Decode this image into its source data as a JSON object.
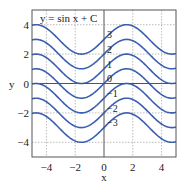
{
  "chart_data": {
    "type": "line",
    "title": "y = sin x + C",
    "xlabel": "x",
    "ylabel": "y",
    "xlim": [
      -5,
      5
    ],
    "ylim": [
      -5,
      5
    ],
    "xticks": [
      -4,
      -2,
      0,
      2,
      4
    ],
    "yticks": [
      -4,
      -2,
      0,
      2,
      4
    ],
    "xtick_labels": [
      "−4",
      "−2",
      "0",
      "2",
      "4"
    ],
    "ytick_labels": [
      "−4",
      "−2",
      "0",
      "2",
      "4"
    ],
    "grid": true,
    "grid_style": "dotted",
    "function": "sin(x) + C",
    "series": [
      {
        "name": "C=3",
        "C": 3,
        "label": "3"
      },
      {
        "name": "C=2",
        "C": 2,
        "label": "2"
      },
      {
        "name": "C=1",
        "C": 1,
        "label": "1"
      },
      {
        "name": "C=0",
        "C": 0,
        "label": "0"
      },
      {
        "name": "C=-1",
        "C": -1,
        "label": "−1"
      },
      {
        "name": "C=-2",
        "C": -2,
        "label": "−2"
      },
      {
        "name": "C=-3",
        "C": -3,
        "label": "−3"
      }
    ],
    "line_color": "#3a5fb0"
  }
}
